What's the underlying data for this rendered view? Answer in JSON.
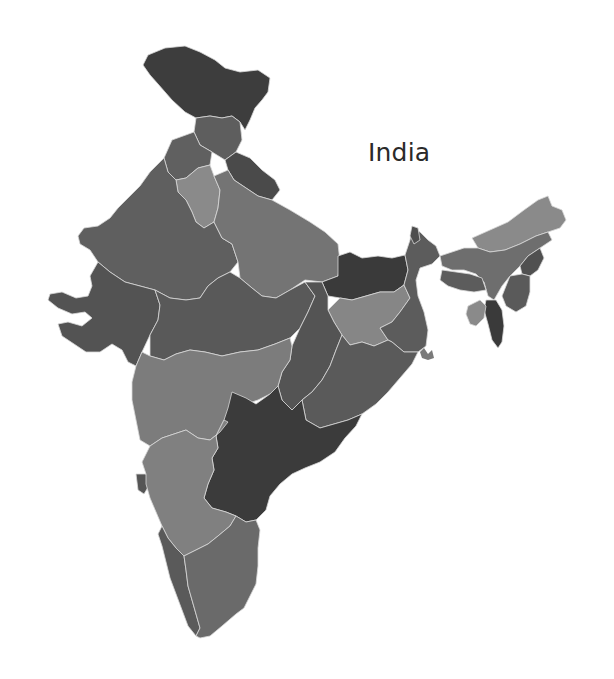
{
  "map": {
    "title": "India",
    "style": "grayscale choropleth",
    "colors": {
      "background": "#ffffff",
      "darkest": "#3a3a3a",
      "dark": "#555555",
      "medium": "#666666",
      "light": "#7e7e7e",
      "lightest": "#8f8f8f",
      "border": "#d8d8d8"
    },
    "regions": [
      {
        "name": "Jammu and Kashmir",
        "shade": "#3d3d3d"
      },
      {
        "name": "Himachal Pradesh",
        "shade": "#5e5e5e"
      },
      {
        "name": "Punjab",
        "shade": "#606060"
      },
      {
        "name": "Uttarakhand",
        "shade": "#4a4a4a"
      },
      {
        "name": "Haryana",
        "shade": "#8a8a8a"
      },
      {
        "name": "Rajasthan",
        "shade": "#5f5f5f"
      },
      {
        "name": "Uttar Pradesh",
        "shade": "#747474"
      },
      {
        "name": "Bihar",
        "shade": "#3a3a3a"
      },
      {
        "name": "Gujarat",
        "shade": "#535353"
      },
      {
        "name": "Madhya Pradesh",
        "shade": "#595959"
      },
      {
        "name": "Jharkhand",
        "shade": "#868686"
      },
      {
        "name": "West Bengal",
        "shade": "#5c5c5c"
      },
      {
        "name": "Chhattisgarh",
        "shade": "#545454"
      },
      {
        "name": "Odisha",
        "shade": "#5a5a5a"
      },
      {
        "name": "Maharashtra",
        "shade": "#7c7c7c"
      },
      {
        "name": "Telangana/Andhra Pradesh",
        "shade": "#3b3b3b"
      },
      {
        "name": "Goa",
        "shade": "#555555"
      },
      {
        "name": "Karnataka",
        "shade": "#808080"
      },
      {
        "name": "Kerala",
        "shade": "#5a5a5a"
      },
      {
        "name": "Tamil Nadu",
        "shade": "#6a6a6a"
      },
      {
        "name": "Sikkim",
        "shade": "#4e4e4e"
      },
      {
        "name": "Arunachal Pradesh",
        "shade": "#8a8a8a"
      },
      {
        "name": "Assam",
        "shade": "#6e6e6e"
      },
      {
        "name": "Meghalaya",
        "shade": "#5c5c5c"
      },
      {
        "name": "Nagaland",
        "shade": "#505050"
      },
      {
        "name": "Manipur",
        "shade": "#5a5a5a"
      },
      {
        "name": "Mizoram",
        "shade": "#3a3a3a"
      },
      {
        "name": "Tripura",
        "shade": "#8a8a8a"
      }
    ]
  }
}
